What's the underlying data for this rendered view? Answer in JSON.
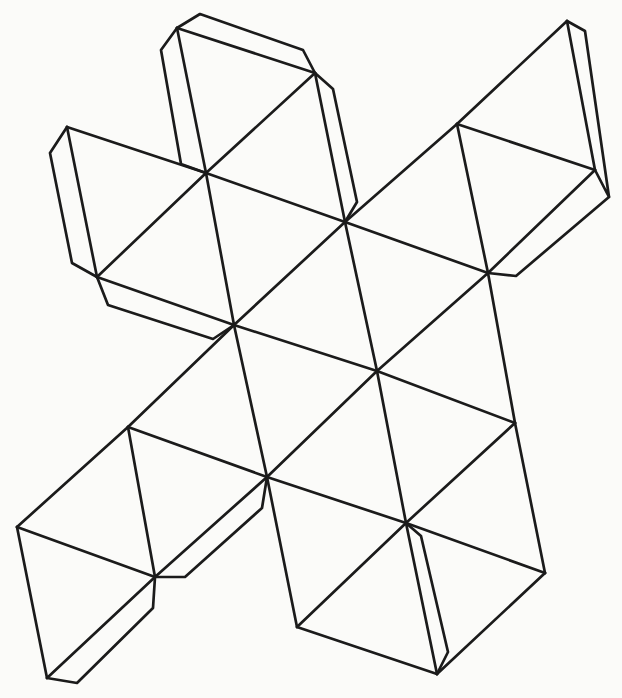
{
  "figure": {
    "kind": "polyhedron-net-line-drawing",
    "canvas": {
      "width": 622,
      "height": 698
    },
    "colors": {
      "background": "#fbfbf9",
      "line": "#1b1b1b"
    },
    "stroke_width": 2.7,
    "vertices": {
      "A": [
        177,
        28
      ],
      "B": [
        315,
        73
      ],
      "C": [
        67,
        127
      ],
      "D": [
        97,
        277
      ],
      "E": [
        457,
        124
      ],
      "F": [
        567,
        21
      ],
      "G": [
        595,
        170
      ],
      "H": [
        128,
        427
      ],
      "I": [
        17,
        527
      ],
      "K": [
        515,
        423
      ],
      "L": [
        545,
        573
      ],
      "M": [
        437,
        674
      ],
      "N": [
        297,
        627
      ],
      "Pj": [
        47,
        678
      ],
      "J1": [
        206,
        173
      ],
      "J2": [
        345,
        222
      ],
      "J3": [
        488,
        273
      ],
      "J4": [
        234,
        325
      ],
      "J5": [
        267,
        477
      ],
      "J6": [
        377,
        371
      ],
      "J7": [
        406,
        523
      ],
      "J8": [
        155,
        577
      ]
    },
    "edges": [
      [
        "A",
        "B"
      ],
      [
        "A",
        "J1"
      ],
      [
        "B",
        "J1"
      ],
      [
        "B",
        "J2"
      ],
      [
        "J1",
        "J2"
      ],
      [
        "C",
        "J1"
      ],
      [
        "C",
        "D"
      ],
      [
        "D",
        "J1"
      ],
      [
        "J1",
        "J4"
      ],
      [
        "D",
        "J4"
      ],
      [
        "J2",
        "J4"
      ],
      [
        "J2",
        "E"
      ],
      [
        "J2",
        "J3"
      ],
      [
        "E",
        "F"
      ],
      [
        "E",
        "G"
      ],
      [
        "E",
        "J3"
      ],
      [
        "F",
        "G"
      ],
      [
        "G",
        "J3"
      ],
      [
        "J2",
        "J6"
      ],
      [
        "J3",
        "J6"
      ],
      [
        "J3",
        "K"
      ],
      [
        "J4",
        "J6"
      ],
      [
        "J4",
        "J5"
      ],
      [
        "J4",
        "H"
      ],
      [
        "H",
        "I"
      ],
      [
        "J5",
        "J6"
      ],
      [
        "J5",
        "H"
      ],
      [
        "J5",
        "J8"
      ],
      [
        "J5",
        "J7"
      ],
      [
        "J5",
        "N"
      ],
      [
        "J6",
        "J7"
      ],
      [
        "J6",
        "K"
      ],
      [
        "K",
        "J7"
      ],
      [
        "K",
        "L"
      ],
      [
        "H",
        "J8"
      ],
      [
        "I",
        "J8"
      ],
      [
        "I",
        "Pj"
      ],
      [
        "J8",
        "Pj"
      ],
      [
        "J7",
        "L"
      ],
      [
        "J7",
        "M"
      ],
      [
        "J7",
        "N"
      ],
      [
        "L",
        "M"
      ],
      [
        "N",
        "M"
      ]
    ],
    "tabs": [
      {
        "name": "tab-top-edge-AB",
        "points": [
          [
            177,
            28
          ],
          [
            200,
            14
          ],
          [
            303,
            50
          ],
          [
            315,
            73
          ]
        ]
      },
      {
        "name": "tab-left-edge-AJ1",
        "points": [
          [
            177,
            28
          ],
          [
            161,
            50
          ],
          [
            181,
            164
          ],
          [
            206,
            173
          ]
        ]
      },
      {
        "name": "tab-left-edge-CD",
        "points": [
          [
            67,
            127
          ],
          [
            50,
            153
          ],
          [
            72,
            263
          ],
          [
            97,
            277
          ]
        ]
      },
      {
        "name": "tab-edge-BJ2",
        "points": [
          [
            315,
            73
          ],
          [
            333,
            89
          ],
          [
            357,
            202
          ],
          [
            345,
            222
          ]
        ]
      },
      {
        "name": "tab-right-edge-FG",
        "points": [
          [
            567,
            21
          ],
          [
            585,
            31
          ],
          [
            609,
            197
          ],
          [
            595,
            170
          ]
        ]
      },
      {
        "name": "tab-edge-GJ3",
        "points": [
          [
            609,
            197
          ],
          [
            516,
            276
          ],
          [
            488,
            273
          ]
        ]
      },
      {
        "name": "tab-edge-DJ4",
        "points": [
          [
            97,
            277
          ],
          [
            108,
            305
          ],
          [
            213,
            339
          ],
          [
            234,
            325
          ]
        ]
      },
      {
        "name": "tab-edge-J5J8",
        "points": [
          [
            267,
            477
          ],
          [
            262,
            508
          ],
          [
            185,
            577
          ],
          [
            155,
            577
          ]
        ]
      },
      {
        "name": "tab-bottom-edge-J8Pj",
        "points": [
          [
            155,
            577
          ],
          [
            153,
            608
          ],
          [
            77,
            683
          ],
          [
            47,
            678
          ]
        ]
      },
      {
        "name": "tab-edge-J7M",
        "points": [
          [
            406,
            523
          ],
          [
            421,
            536
          ],
          [
            448,
            652
          ],
          [
            437,
            674
          ]
        ]
      }
    ]
  }
}
